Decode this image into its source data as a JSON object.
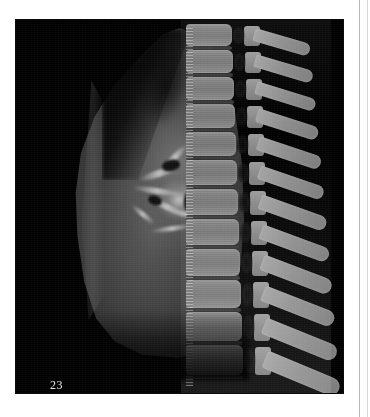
{
  "page": {
    "background_color": "#ffffff",
    "gutter_line_color": "#b9b9b9"
  },
  "figure": {
    "label": "23",
    "label_color": "#e8e8e8",
    "panel_background": "#000000",
    "modality": "ct-sagittal-thorax",
    "anatomy_regions": [
      "lung-parenchyma",
      "pulmonary-hilum",
      "thoracic-vertebral-column",
      "spinous-processes",
      "intervertebral-discs",
      "spinal-canal",
      "diaphragm"
    ]
  },
  "spine": {
    "bone_color": "#8a8a8a",
    "disc_color": "#3a3a3a",
    "canal_color": "#0a0a0a",
    "vertebrae": [
      {
        "y": 4,
        "h": 22,
        "w": 46,
        "sp_y": 8,
        "sp_w": 58,
        "sp_h": 13
      },
      {
        "y": 30,
        "h": 23,
        "w": 47,
        "sp_y": 34,
        "sp_w": 60,
        "sp_h": 13
      },
      {
        "y": 57,
        "h": 23,
        "w": 48,
        "sp_y": 61,
        "sp_w": 62,
        "sp_h": 13
      },
      {
        "y": 84,
        "h": 24,
        "w": 49,
        "sp_y": 88,
        "sp_w": 64,
        "sp_h": 14
      },
      {
        "y": 112,
        "h": 24,
        "w": 50,
        "sp_y": 116,
        "sp_w": 66,
        "sp_h": 14
      },
      {
        "y": 140,
        "h": 25,
        "w": 51,
        "sp_y": 145,
        "sp_w": 68,
        "sp_h": 14
      },
      {
        "y": 169,
        "h": 26,
        "w": 52,
        "sp_y": 174,
        "sp_w": 70,
        "sp_h": 15
      },
      {
        "y": 199,
        "h": 26,
        "w": 53,
        "sp_y": 204,
        "sp_w": 72,
        "sp_h": 15
      },
      {
        "y": 229,
        "h": 27,
        "w": 54,
        "sp_y": 234,
        "sp_w": 74,
        "sp_h": 16
      },
      {
        "y": 260,
        "h": 28,
        "w": 55,
        "sp_y": 265,
        "sp_w": 76,
        "sp_h": 16
      },
      {
        "y": 292,
        "h": 29,
        "w": 56,
        "sp_y": 297,
        "sp_w": 78,
        "sp_h": 17
      },
      {
        "y": 325,
        "h": 30,
        "w": 57,
        "sp_y": 330,
        "sp_w": 80,
        "sp_h": 18
      }
    ]
  },
  "hilum": {
    "vessels": [
      {
        "x": 10,
        "y": 28,
        "w": 42,
        "h": 7,
        "rot": -18
      },
      {
        "x": 4,
        "y": 46,
        "w": 50,
        "h": 6,
        "rot": 8
      },
      {
        "x": 16,
        "y": 62,
        "w": 46,
        "h": 6,
        "rot": 26
      },
      {
        "x": 30,
        "y": 12,
        "w": 34,
        "h": 6,
        "rot": -46
      },
      {
        "x": 40,
        "y": 70,
        "w": 40,
        "h": 5,
        "rot": 12
      },
      {
        "x": 22,
        "y": 84,
        "w": 44,
        "h": 5,
        "rot": -8
      },
      {
        "x": 52,
        "y": 40,
        "w": 36,
        "h": 5,
        "rot": -30
      },
      {
        "x": 0,
        "y": 70,
        "w": 30,
        "h": 5,
        "rot": 40
      }
    ],
    "bronchi": [
      {
        "x": 34,
        "y": 18,
        "w": 18,
        "h": 11,
        "rot": -12
      },
      {
        "x": 56,
        "y": 46,
        "w": 20,
        "h": 26,
        "rot": 6
      },
      {
        "x": 20,
        "y": 54,
        "w": 14,
        "h": 9,
        "rot": 20
      },
      {
        "x": 62,
        "y": 16,
        "w": 12,
        "h": 9,
        "rot": -20
      }
    ]
  }
}
